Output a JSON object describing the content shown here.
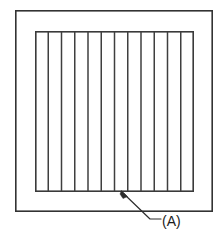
{
  "figure": {
    "background_color": "#ffffff",
    "line_color": "#3a3a3a",
    "text_color": "#1b1b1b",
    "width": 224,
    "height": 241
  },
  "outer_frame": {
    "name": "outer frame",
    "x": 15,
    "y": 10,
    "width": 198,
    "height": 202,
    "stroke": "#333333"
  },
  "inner_panel": {
    "name": "inner louvered panel",
    "x": 35,
    "y": 31,
    "width": 159,
    "height": 161,
    "stroke": "#3a3a3a",
    "slat_count": 11,
    "slat_spacing": 13.25,
    "slat_positions": [
      48.25,
      61.5,
      74.75,
      88,
      101.25,
      114.5,
      127.75,
      141,
      154.25,
      167.5,
      180.75
    ]
  },
  "callout": {
    "label": "(A)",
    "label_x": 162,
    "label_y": 226,
    "arrow_tip_x": 122,
    "arrow_tip_y": 192,
    "elbow_x": 150,
    "elbow_y": 219,
    "tail_end_x": 161,
    "tail_end_y": 219,
    "stroke": "#2e2e2e"
  }
}
